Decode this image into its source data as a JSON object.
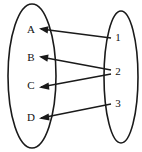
{
  "diagram": {
    "type": "mapping-diagram",
    "background_color": "#ffffff",
    "stroke_color": "#1a1a1a",
    "domain_set": {
      "name": "right-oval-set",
      "elements": [
        {
          "id": "1",
          "label": "1",
          "x": 118,
          "y": 38
        },
        {
          "id": "2",
          "label": "2",
          "x": 118,
          "y": 72
        },
        {
          "id": "3",
          "label": "3",
          "x": 118,
          "y": 104
        }
      ],
      "ellipse": {
        "cx": 121,
        "cy": 77,
        "rx": 17,
        "ry": 66
      }
    },
    "codomain_set": {
      "name": "left-oval-set",
      "elements": [
        {
          "id": "A",
          "label": "A",
          "x": 31,
          "y": 30
        },
        {
          "id": "B",
          "label": "B",
          "x": 31,
          "y": 58
        },
        {
          "id": "C",
          "label": "C",
          "x": 31,
          "y": 86
        },
        {
          "id": "D",
          "label": "D",
          "x": 31,
          "y": 118
        }
      ],
      "ellipse": {
        "cx": 32,
        "cy": 76,
        "rx": 24,
        "ry": 72
      }
    },
    "arrows": [
      {
        "id": "arrow-1-to-A",
        "from": "1",
        "to": "A",
        "x1": 111,
        "y1": 38,
        "x2": 39,
        "y2": 29
      },
      {
        "id": "arrow-2-to-B",
        "from": "2",
        "to": "B",
        "x1": 111,
        "y1": 70,
        "x2": 39,
        "y2": 57
      },
      {
        "id": "arrow-2-to-C",
        "from": "2",
        "to": "C",
        "x1": 111,
        "y1": 74,
        "x2": 39,
        "y2": 87
      },
      {
        "id": "arrow-3-to-D",
        "from": "3",
        "to": "D",
        "x1": 111,
        "y1": 104,
        "x2": 39,
        "y2": 118
      }
    ]
  }
}
